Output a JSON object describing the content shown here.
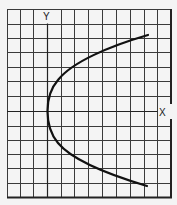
{
  "diagram": {
    "type": "graph-paper-plot",
    "axes": {
      "x_label": "X",
      "y_label": "Y"
    },
    "grid": {
      "columns": 12,
      "rows": 13,
      "origin_column": 3,
      "origin_row": 7
    },
    "curve": {
      "shape": "parabola",
      "opens": "right",
      "vertex_grid": [
        0,
        0
      ],
      "top_end_grid": [
        7.2,
        5.3
      ],
      "bottom_end_grid": [
        7.1,
        -5.1
      ]
    },
    "colors": {
      "background": "#f4f4f4",
      "grid": "#3a3a3a",
      "curve": "#111111"
    }
  }
}
